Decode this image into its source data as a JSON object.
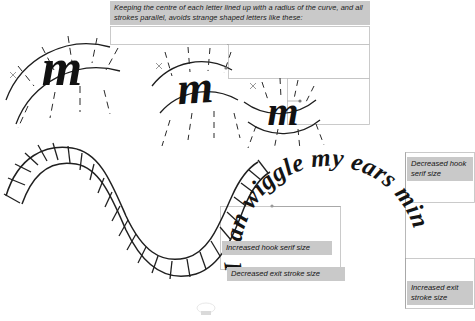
{
  "page": {
    "background_color": "#ffffff",
    "ink_color": "#1a1a1a",
    "tag_background_color": "#c9c9c9",
    "box_border_color": "#b9b9b9"
  },
  "caption": {
    "text": "Keeping the centre of each letter lined up with a radius of the curve, and all strokes parallel, avoids strange shaped letters like these:"
  },
  "specimens": [
    {
      "name": "letter-m-convex-upright",
      "glyph": "m"
    },
    {
      "name": "letter-m-convex-skewed",
      "glyph": "m"
    },
    {
      "name": "letter-m-concave",
      "glyph": "m"
    }
  ],
  "wave_guide": {
    "name": "sinusoidal-ribbon-guide",
    "rung_count": 28
  },
  "circular_text": {
    "text": "I can wiggle my ears minimally",
    "letters": [
      "I",
      "c",
      "a",
      "n",
      " ",
      "w",
      "i",
      "g",
      "g",
      "l",
      "e",
      " ",
      "m",
      "y",
      " ",
      "e",
      "a",
      "r",
      "s",
      " ",
      "m",
      "i",
      "n",
      "i",
      "m",
      "a",
      "l",
      "l",
      "y"
    ]
  },
  "annotations": [
    {
      "id": "increased-hook-serif-size",
      "text": "Increased hook serif size"
    },
    {
      "id": "decreased-exit-stroke-size",
      "text": "Decreased exit stroke size"
    },
    {
      "id": "decreased-hook-serif-size",
      "text": "Decreased hook serif size"
    },
    {
      "id": "increased-exit-stroke-size",
      "text": "Increased exit stroke size"
    }
  ]
}
